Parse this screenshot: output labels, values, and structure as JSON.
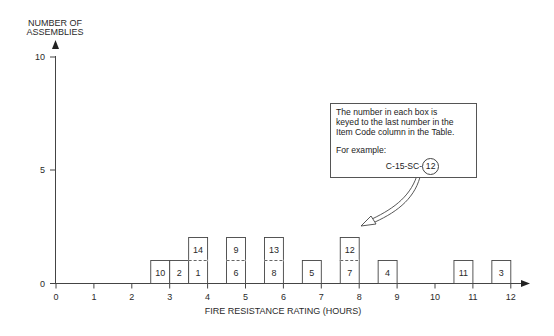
{
  "chart_data": {
    "type": "bar",
    "subtype": "stacked-unit-boxes (histogram)",
    "title": "",
    "ylabel": "NUMBER OF ASSEMBLIES",
    "xlabel": "FIRE RESISTANCE RATING (HOURS)",
    "ylim": [
      0,
      10
    ],
    "xlim": [
      0,
      12
    ],
    "yticks": [
      "0",
      "5",
      "10"
    ],
    "xticks": [
      "0",
      "1",
      "2",
      "3",
      "4",
      "5",
      "6",
      "7",
      "8",
      "9",
      "10",
      "11",
      "12"
    ],
    "grid": false,
    "boxes": [
      {
        "label": "10",
        "x_start": 2.5,
        "x_end": 3.0,
        "level": 0
      },
      {
        "label": "2",
        "x_start": 3.0,
        "x_end": 3.5,
        "level": 0
      },
      {
        "label": "1",
        "x_start": 3.5,
        "x_end": 4.0,
        "level": 0
      },
      {
        "label": "14",
        "x_start": 3.5,
        "x_end": 4.0,
        "level": 1
      },
      {
        "label": "6",
        "x_start": 4.5,
        "x_end": 5.0,
        "level": 0
      },
      {
        "label": "9",
        "x_start": 4.5,
        "x_end": 5.0,
        "level": 1
      },
      {
        "label": "8",
        "x_start": 5.5,
        "x_end": 6.0,
        "level": 0
      },
      {
        "label": "13",
        "x_start": 5.5,
        "x_end": 6.0,
        "level": 1
      },
      {
        "label": "5",
        "x_start": 6.5,
        "x_end": 7.0,
        "level": 0
      },
      {
        "label": "7",
        "x_start": 7.5,
        "x_end": 8.0,
        "level": 0
      },
      {
        "label": "12",
        "x_start": 7.5,
        "x_end": 8.0,
        "level": 1
      },
      {
        "label": "4",
        "x_start": 8.5,
        "x_end": 9.0,
        "level": 0
      },
      {
        "label": "11",
        "x_start": 10.5,
        "x_end": 11.0,
        "level": 0
      },
      {
        "label": "3",
        "x_start": 11.5,
        "x_end": 12.0,
        "level": 0
      }
    ],
    "categories": [
      "2.5-3",
      "3-3.5",
      "3.5-4",
      "4.5-5",
      "5.5-6",
      "6.5-7",
      "7.5-8",
      "8.5-9",
      "10.5-11",
      "11.5-12"
    ],
    "values": [
      1,
      1,
      2,
      2,
      2,
      1,
      2,
      1,
      1,
      1
    ],
    "annotation": {
      "lines": [
        "The number in each box is",
        "keyed to the last number in the",
        "Item Code column in the Table."
      ],
      "example_label": "For example:",
      "example_prefix": "C-15-SC-",
      "example_circled": "12",
      "arrow_points_to_box": "12"
    }
  }
}
